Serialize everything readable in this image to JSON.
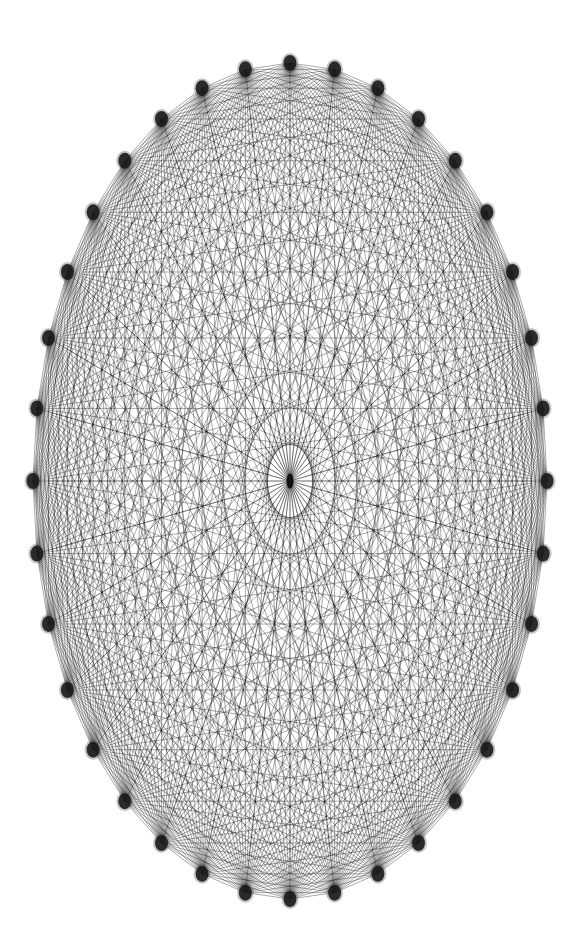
{
  "diagram": {
    "type": "complete-graph-with-hub",
    "canvas": {
      "width": 587,
      "height": 947,
      "background": "#ffffff"
    },
    "layout": {
      "shape": "ellipse",
      "center": [
        290,
        481
      ],
      "rx": 257,
      "ry": 418,
      "start_angle_deg": 0,
      "angle_step_deg": 10,
      "start_position": "top"
    },
    "ring_nodes": {
      "count": 36,
      "rx": 6.5,
      "ry": 8,
      "color": "#1a1a1a",
      "blur_halo": "#555555"
    },
    "hub_node": {
      "present": true,
      "rx": 3.5,
      "ry": 7.5,
      "color": "#111111"
    },
    "edges": {
      "ring_complete": true,
      "hub_to_ring": true,
      "stroke": "#000000",
      "stroke_width": 0.45,
      "opacity": 0.75
    }
  }
}
